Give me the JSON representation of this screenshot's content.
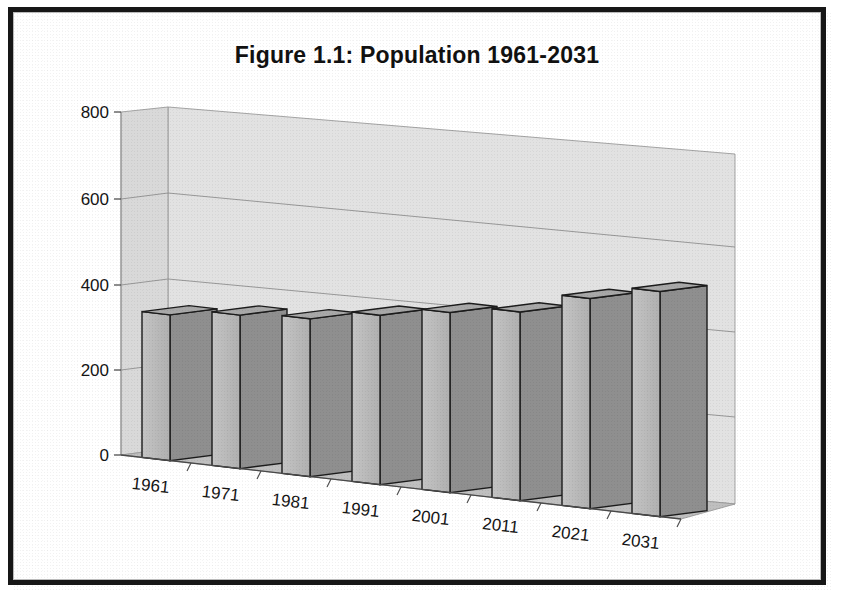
{
  "figure": {
    "title": "Figure 1.1: Population 1961-2031",
    "border_color": "#171717",
    "background_color": "#ffffff"
  },
  "chart_data": {
    "type": "bar",
    "title": "Figure 1.1: Population 1961-2031",
    "xlabel": "",
    "ylabel": "",
    "categories": [
      "1961",
      "1971",
      "1981",
      "1991",
      "2001",
      "2011",
      "2021",
      "2031"
    ],
    "values": [
      340,
      358,
      368,
      395,
      420,
      440,
      490,
      525
    ],
    "ylim": [
      0,
      800
    ],
    "yticks": [
      0,
      200,
      400,
      600,
      800
    ],
    "ytick_labels": [
      "0",
      "200",
      "400",
      "600",
      "800"
    ],
    "grid": true,
    "legend": "none",
    "style": "3d-column",
    "colors": {
      "bar_front": "#b9b9b9",
      "bar_side": "#8f8f8f",
      "bar_top": "#a8a8a8",
      "bar_outline": "#1c1c1c",
      "wall_back": "#e0e0e0",
      "wall_side": "#d6d6d6",
      "floor": "#bdbdbd",
      "gridline": "#8c8c8c"
    }
  }
}
